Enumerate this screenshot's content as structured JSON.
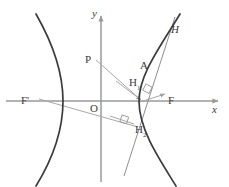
{
  "figure": {
    "kind": "geometry-diagram",
    "canvas": {
      "width": 229,
      "height": 187
    },
    "colors": {
      "background": "#ffffff",
      "curve": "#3c3c3c",
      "axis": "#9a9a9a",
      "construction_line": "#a8a8a8",
      "tangent_line": "#8e8e8e",
      "label_text": "#3a3a3a",
      "right_angle_mark": "#9a9a9a"
    },
    "origin": {
      "x": 101,
      "y": 101
    },
    "axes": {
      "x": {
        "label": "x",
        "italic": true,
        "from": {
          "x": 6,
          "y": 101
        },
        "to": {
          "x": 220,
          "y": 101
        },
        "arrow": true,
        "label_pos": {
          "x": 212,
          "y": 106
        }
      },
      "y": {
        "label": "y",
        "italic": true,
        "from": {
          "x": 101,
          "y": 182
        },
        "to": {
          "x": 101,
          "y": 14
        },
        "arrow": true,
        "label_pos": {
          "x": 92,
          "y": 10
        }
      }
    },
    "hyperbola": {
      "label": "H",
      "italic": true,
      "label_pos": {
        "x": 171,
        "y": 27
      },
      "center": {
        "x": 101,
        "y": 101
      },
      "a": 38,
      "b": 46,
      "left_vertex": {
        "x": 63,
        "y": 101
      },
      "right_vertex": {
        "x": 139,
        "y": 101
      },
      "branches": [
        "left",
        "right"
      ]
    },
    "points": [
      {
        "name": "F-prime",
        "label": "F'",
        "at": {
          "x": 41,
          "y": 101
        },
        "label_pos": {
          "x": 22,
          "y": 96
        },
        "role": "left-focus"
      },
      {
        "name": "F",
        "label": "F",
        "at": {
          "x": 161,
          "y": 101
        },
        "label_pos": {
          "x": 168,
          "y": 96
        },
        "role": "right-focus"
      },
      {
        "name": "O",
        "label": "O",
        "at": {
          "x": 101,
          "y": 101
        },
        "label_pos": {
          "x": 93,
          "y": 104
        },
        "role": "origin"
      },
      {
        "name": "P",
        "label": "P",
        "at": {
          "x": 92,
          "y": 62
        },
        "label_pos": {
          "x": 86,
          "y": 55
        },
        "role": "external-point"
      },
      {
        "name": "A",
        "label": "A",
        "at": {
          "x": 146,
          "y": 70
        },
        "label_pos": {
          "x": 140,
          "y": 62
        },
        "role": "point-on-curve"
      },
      {
        "name": "H1",
        "label": "H",
        "sub": "1",
        "at": {
          "x": 142,
          "y": 101
        },
        "label_pos": {
          "x": 130,
          "y": 79
        },
        "role": "foot-of-perpendicular-from-F"
      },
      {
        "name": "H2",
        "label": "H",
        "sub": "2",
        "at": {
          "x": 132,
          "y": 123
        },
        "label_pos": {
          "x": 135,
          "y": 126
        },
        "role": "foot-of-perpendicular-from-F-prime"
      }
    ],
    "segments": [
      {
        "name": "P-to-foot",
        "from": {
          "x": 96,
          "y": 60
        },
        "to": {
          "x": 143,
          "y": 101
        },
        "arrow": true
      },
      {
        "name": "F-prime-to-H2",
        "from": {
          "x": 39,
          "y": 99
        },
        "to": {
          "x": 137,
          "y": 127
        },
        "arrow": false
      },
      {
        "name": "foot-to-F",
        "from": {
          "x": 140,
          "y": 102
        },
        "to": {
          "x": 167,
          "y": 93
        },
        "arrow": true
      },
      {
        "name": "left-ray-to-vertex",
        "from": {
          "x": 118,
          "y": 82
        },
        "to": {
          "x": 143,
          "y": 101
        },
        "arrow": true
      },
      {
        "name": "lower-left-ray",
        "from": {
          "x": 112,
          "y": 117
        },
        "to": {
          "x": 133,
          "y": 124
        },
        "arrow": false
      },
      {
        "name": "tangent-line",
        "from": {
          "x": 175,
          "y": 17
        },
        "to": {
          "x": 124,
          "y": 176
        },
        "arrow": false
      }
    ],
    "right_angles": [
      {
        "name": "right-angle-at-H1",
        "at": {
          "x": 150,
          "y": 89
        },
        "size": 7,
        "rotation": 28
      },
      {
        "name": "right-angle-at-H2",
        "at": {
          "x": 126,
          "y": 120
        },
        "size": 7,
        "rotation": 18
      }
    ]
  }
}
